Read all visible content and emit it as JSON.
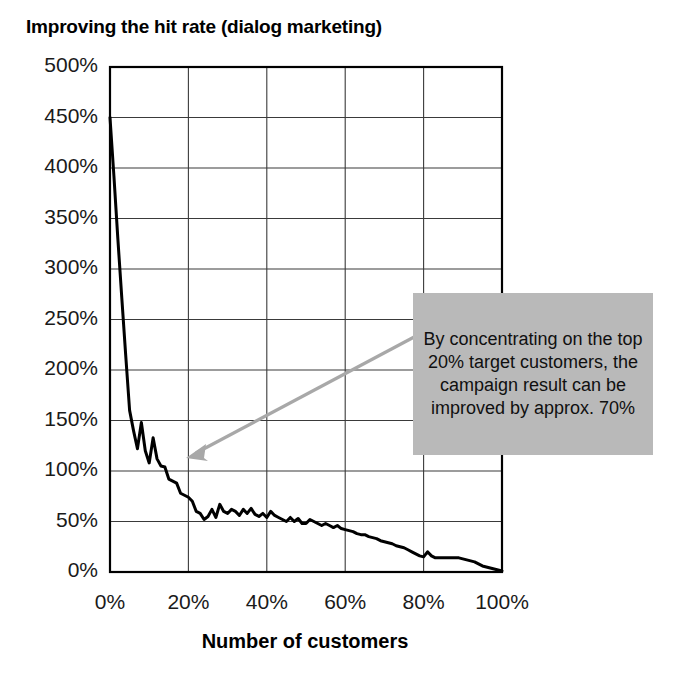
{
  "chart_data": {
    "type": "line",
    "title": "Improving the hit rate (dialog marketing)",
    "xlabel": "Number of customers",
    "ylabel": "",
    "xlim": [
      0,
      100
    ],
    "ylim": [
      0,
      500
    ],
    "grid": true,
    "legend_position": "none",
    "x_tick_labels": [
      "0%",
      "20%",
      "40%",
      "60%",
      "80%",
      "100%"
    ],
    "x_ticks": [
      0,
      20,
      40,
      60,
      80,
      100
    ],
    "y_tick_labels": [
      "0%",
      "50%",
      "100%",
      "150%",
      "200%",
      "250%",
      "300%",
      "350%",
      "400%",
      "450%",
      "500%"
    ],
    "y_ticks": [
      0,
      50,
      100,
      150,
      200,
      250,
      300,
      350,
      400,
      450,
      500
    ],
    "series": [
      {
        "name": "hit rate",
        "color": "#000000",
        "x": [
          0,
          1,
          2,
          3,
          4,
          5,
          6,
          7,
          8,
          9,
          10,
          11,
          12,
          13,
          14,
          15,
          16,
          17,
          18,
          19,
          20,
          21,
          22,
          23,
          24,
          25,
          26,
          27,
          28,
          29,
          30,
          31,
          32,
          33,
          34,
          35,
          36,
          37,
          38,
          39,
          40,
          41,
          42,
          43,
          44,
          45,
          46,
          47,
          48,
          49,
          50,
          51,
          52,
          53,
          54,
          55,
          56,
          57,
          58,
          59,
          60,
          61,
          62,
          63,
          64,
          65,
          66,
          67,
          68,
          69,
          70,
          71,
          72,
          73,
          74,
          75,
          76,
          77,
          78,
          79,
          80,
          81,
          82,
          83,
          84,
          85,
          86,
          87,
          88,
          89,
          90,
          91,
          92,
          93,
          94,
          95,
          96,
          97,
          98,
          99,
          100
        ],
        "y": [
          450,
          392,
          330,
          272,
          215,
          160,
          140,
          122,
          148,
          120,
          108,
          133,
          112,
          105,
          104,
          92,
          90,
          88,
          78,
          76,
          74,
          70,
          60,
          58,
          52,
          55,
          62,
          54,
          67,
          60,
          58,
          62,
          60,
          56,
          62,
          58,
          63,
          57,
          55,
          58,
          54,
          60,
          56,
          54,
          52,
          50,
          54,
          50,
          53,
          48,
          48,
          52,
          50,
          48,
          46,
          48,
          46,
          44,
          46,
          43,
          42,
          41,
          40,
          38,
          37,
          37,
          35,
          34,
          33,
          31,
          30,
          29,
          28,
          26,
          25,
          24,
          22,
          20,
          18,
          16,
          15,
          20,
          16,
          14,
          14,
          14,
          14,
          14,
          14,
          14,
          13,
          12,
          11,
          10,
          8,
          6,
          5,
          4,
          3,
          2,
          1
        ]
      }
    ],
    "annotations": [
      {
        "id": "callout",
        "text": "By concentrating on the top 20% target customers, the campaign result can be improved by approx. 70%",
        "background_color": "#b9b9b9",
        "arrow_color": "#a8a8a8",
        "arrow_from_x": 100,
        "arrow_from_y": 200,
        "arrow_to_x": 20,
        "arrow_to_y": 115
      }
    ]
  }
}
